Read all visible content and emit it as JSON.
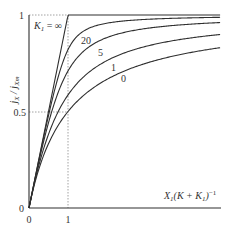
{
  "chart_data": {
    "type": "line",
    "title": "",
    "xlabel": "X1(K + K1)^-1",
    "ylabel": "jX / jXm",
    "xlim": [
      0,
      4.9
    ],
    "ylim": [
      0,
      1
    ],
    "x_ticks": [
      "0",
      "1"
    ],
    "y_ticks": [
      "0",
      "0.5",
      "1"
    ],
    "grid": false,
    "legend": "inline curve labels",
    "reference_lines": [
      {
        "type": "dotted",
        "description": "horizontal at y=0.5 from x=0 to x=1"
      },
      {
        "type": "dotted",
        "description": "vertical at x=1 from y=0 to y=1"
      },
      {
        "type": "dotted",
        "description": "horizontal at y=1 from x=0 to x=1"
      }
    ],
    "series": [
      {
        "name": "K1 = ∞",
        "label": "K1 = ∞",
        "theta": 1.0,
        "x": [
          0,
          1,
          4.9
        ],
        "values": [
          0,
          1,
          1
        ]
      },
      {
        "name": "K1 = 20",
        "label": "20",
        "theta": 0.952,
        "x": [
          0,
          0.5,
          1,
          2,
          3,
          4.9
        ],
        "values": [
          0,
          0.47,
          0.82,
          0.95,
          0.97,
          0.985
        ]
      },
      {
        "name": "K1 = 5",
        "label": "5",
        "theta": 0.833,
        "x": [
          0,
          0.5,
          1,
          2,
          3,
          4.9
        ],
        "values": [
          0,
          0.43,
          0.71,
          0.89,
          0.93,
          0.96
        ]
      },
      {
        "name": "K1 = 1",
        "label": "1",
        "theta": 0.5,
        "x": [
          0,
          0.5,
          1,
          2,
          3,
          4.9
        ],
        "values": [
          0,
          0.38,
          0.59,
          0.78,
          0.85,
          0.9
        ]
      },
      {
        "name": "K1 = 0",
        "label": "0",
        "theta": 0.0,
        "x": [
          0,
          0.5,
          1,
          2,
          3,
          4.9
        ],
        "values": [
          0,
          0.33,
          0.5,
          0.67,
          0.75,
          0.83
        ]
      }
    ]
  },
  "axes": {
    "y_tick_1": "1",
    "y_tick_half": "0.5",
    "y_tick_0": "0",
    "x_tick_0": "0",
    "x_tick_1": "1",
    "y_label_main": "j",
    "y_label_sub1": "X",
    "y_label_slash": " / j",
    "y_label_sub2": "Xm",
    "x_label_main": "X",
    "x_label_sub": "1",
    "x_label_mid": "(K + K",
    "x_label_sub2": "1",
    "x_label_end": ")",
    "x_label_sup": "−1"
  },
  "labels": {
    "k_inf_main": "K",
    "k_inf_sub": "1",
    "k_inf_eq": " = ∞",
    "curve_20": "20",
    "curve_5": "5",
    "curve_1": "1",
    "curve_0": "0"
  },
  "colors": {
    "line": "#2f2f2f",
    "dotted": "#8a8a8a",
    "axis": "#2f2f2f"
  }
}
